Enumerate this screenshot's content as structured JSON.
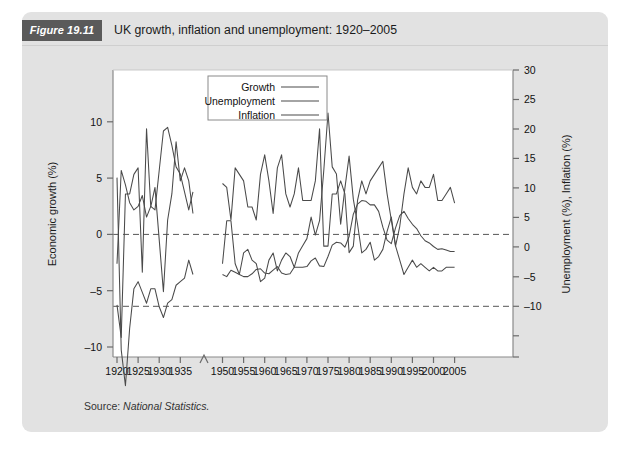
{
  "figure": {
    "badge": "Figure 19.11",
    "title": "UK growth, inflation and unemployment: 1920–2005",
    "source_prefix": "Source:",
    "source_name": "National Statistics."
  },
  "colors": {
    "card_background": "#e2e2e2",
    "badge_background": "#5a5a5a",
    "badge_text": "#ffffff",
    "plot_background": "#ffffff",
    "line": "#4a4a4a",
    "axis": "#6b6b6b",
    "dashed_reference": "#5a5a5a"
  },
  "chart_data": {
    "type": "line",
    "title": "UK growth, inflation and unemployment: 1920–2005",
    "xlabel": "",
    "ylabel": "Economic growth (%)",
    "y2label": "Unemployment (%), Inflation (%)",
    "xlim": [
      1920,
      2005
    ],
    "ylim": [
      -10,
      12
    ],
    "y2lim": [
      -10,
      30
    ],
    "grid": false,
    "legend_position": "top-center",
    "axis_break": {
      "from": 1938,
      "to": 1948,
      "note": "war years omitted"
    },
    "yticks": [
      -10,
      -5,
      0,
      5,
      10
    ],
    "y2ticks": [
      -10,
      -5,
      0,
      5,
      10,
      15,
      20,
      25,
      30
    ],
    "xticks": [
      1920,
      1925,
      1930,
      1935,
      1950,
      1955,
      1960,
      1965,
      1970,
      1975,
      1980,
      1985,
      1990,
      1995,
      2000,
      2005
    ],
    "reference_lines": [
      {
        "label": "growth zero",
        "axis": "left",
        "value": 0,
        "style": "dashed"
      },
      {
        "label": "right-axis zero",
        "axis": "right",
        "value": 0,
        "style": "dashed"
      }
    ],
    "series": [
      {
        "name": "Growth",
        "axis": "left",
        "unit": "%",
        "x": [
          1920,
          1921,
          1922,
          1923,
          1924,
          1925,
          1926,
          1927,
          1928,
          1929,
          1930,
          1931,
          1932,
          1933,
          1934,
          1935,
          1936,
          1937,
          1938,
          1950,
          1951,
          1952,
          1953,
          1954,
          1955,
          1956,
          1957,
          1958,
          1959,
          1960,
          1961,
          1962,
          1963,
          1964,
          1965,
          1966,
          1967,
          1968,
          1969,
          1970,
          1971,
          1972,
          1973,
          1974,
          1975,
          1976,
          1977,
          1978,
          1979,
          1980,
          1981,
          1982,
          1983,
          1984,
          1985,
          1986,
          1987,
          1988,
          1989,
          1990,
          1991,
          1992,
          1993,
          1994,
          1995,
          1996,
          1997,
          1998,
          1999,
          2000,
          2001,
          2002,
          2003,
          2004,
          2005
        ],
        "values": [
          -6.0,
          -8.5,
          2.5,
          2.5,
          4.0,
          4.5,
          -3.5,
          7.5,
          1.5,
          3.0,
          -1.0,
          -5.0,
          0.5,
          2.5,
          6.5,
          3.5,
          4.5,
          3.5,
          1.0,
          3.3,
          3.0,
          0.5,
          4.5,
          4.0,
          3.5,
          1.5,
          1.5,
          0.5,
          4.0,
          5.5,
          3.5,
          1.0,
          4.5,
          5.5,
          2.5,
          1.5,
          2.5,
          4.5,
          2.0,
          2.0,
          2.0,
          3.5,
          7.5,
          -1.5,
          -1.5,
          2.5,
          2.5,
          3.5,
          2.5,
          -2.0,
          -1.5,
          2.0,
          3.5,
          2.5,
          3.5,
          4.0,
          4.5,
          5.0,
          2.5,
          0.5,
          -1.5,
          0.0,
          2.5,
          4.5,
          3.0,
          2.5,
          3.5,
          3.0,
          3.0,
          4.0,
          2.0,
          2.0,
          2.5,
          3.0,
          1.8
        ],
        "notes": "1921 post-war slump trough near -9; 1973 peak ~7.5; 1975 and 1980 recessions negative"
      },
      {
        "name": "Unemployment",
        "axis": "right",
        "unit": "%",
        "x": [
          1920,
          1921,
          1922,
          1923,
          1924,
          1925,
          1926,
          1927,
          1928,
          1929,
          1930,
          1931,
          1932,
          1933,
          1934,
          1935,
          1936,
          1937,
          1938,
          1950,
          1951,
          1952,
          1953,
          1954,
          1955,
          1956,
          1957,
          1958,
          1959,
          1960,
          1961,
          1962,
          1963,
          1964,
          1965,
          1966,
          1967,
          1968,
          1969,
          1970,
          1971,
          1972,
          1973,
          1974,
          1975,
          1976,
          1977,
          1978,
          1979,
          1980,
          1981,
          1982,
          1983,
          1984,
          1985,
          1986,
          1987,
          1988,
          1989,
          1990,
          1991,
          1992,
          1993,
          1994,
          1995,
          1996,
          1997,
          1998,
          1999,
          2000,
          2001,
          2002,
          2003,
          2004,
          2005
        ],
        "values": [
          3.0,
          16.0,
          14.0,
          11.5,
          10.5,
          11.0,
          12.5,
          9.5,
          11.0,
          10.5,
          16.0,
          21.5,
          22.0,
          19.5,
          16.5,
          15.5,
          13.0,
          10.5,
          13.0,
          1.5,
          1.2,
          2.1,
          1.8,
          1.5,
          1.2,
          1.2,
          1.6,
          2.2,
          2.3,
          1.7,
          1.6,
          2.1,
          2.6,
          1.7,
          1.5,
          1.6,
          2.5,
          2.5,
          2.5,
          2.6,
          3.4,
          3.8,
          2.7,
          2.6,
          4.0,
          5.6,
          6.0,
          5.9,
          5.3,
          6.8,
          9.9,
          11.3,
          11.8,
          11.7,
          11.2,
          11.2,
          10.3,
          8.1,
          6.3,
          5.8,
          8.0,
          9.7,
          10.3,
          9.3,
          8.5,
          7.9,
          6.9,
          6.2,
          5.9,
          5.4,
          5.0,
          5.1,
          4.9,
          4.7,
          4.7
        ],
        "notes": "Interwar mass unemployment peaking ~22% in 1932; post-war low ~1-2%; 1980s peak ~12%"
      },
      {
        "name": "Inflation",
        "axis": "right",
        "unit": "%",
        "x": [
          1920,
          1921,
          1922,
          1923,
          1924,
          1925,
          1926,
          1927,
          1928,
          1929,
          1930,
          1931,
          1932,
          1933,
          1934,
          1935,
          1936,
          1937,
          1938,
          1950,
          1951,
          1952,
          1953,
          1954,
          1955,
          1956,
          1957,
          1958,
          1959,
          1960,
          1961,
          1962,
          1963,
          1964,
          1965,
          1966,
          1967,
          1968,
          1969,
          1970,
          1971,
          1972,
          1973,
          1974,
          1975,
          1976,
          1977,
          1978,
          1979,
          1980,
          1981,
          1982,
          1983,
          1984,
          1985,
          1986,
          1987,
          1988,
          1989,
          1990,
          1991,
          1992,
          1993,
          1994,
          1995,
          1996,
          1997,
          1998,
          1999,
          2000,
          2001,
          2002,
          2003,
          2004,
          2005
        ],
        "values": [
          15.0,
          -9.0,
          -14.0,
          -6.0,
          -0.5,
          0.5,
          -1.0,
          -2.5,
          -0.5,
          -0.5,
          -3.0,
          -4.5,
          -2.5,
          -2.0,
          0.0,
          0.5,
          1.0,
          3.5,
          1.5,
          3.0,
          9.0,
          9.0,
          3.0,
          1.5,
          4.5,
          5.0,
          3.5,
          3.0,
          0.5,
          1.0,
          3.5,
          4.5,
          2.0,
          3.5,
          4.5,
          4.0,
          2.5,
          4.5,
          5.5,
          6.5,
          9.5,
          7.0,
          9.0,
          16.0,
          24.0,
          16.5,
          15.5,
          8.5,
          13.5,
          18.0,
          12.0,
          8.5,
          4.5,
          5.0,
          6.0,
          3.5,
          4.0,
          5.0,
          7.5,
          9.5,
          5.5,
          3.5,
          1.5,
          2.5,
          3.5,
          2.5,
          3.0,
          2.5,
          2.0,
          2.5,
          2.0,
          2.0,
          2.5,
          2.5,
          2.5
        ],
        "notes": "Sharp post-WWI deflation to about -14% in 1922; 1975 peak about 24%; low stable ~2-3% after 1993"
      }
    ]
  },
  "legend": {
    "entries": [
      {
        "label": "Growth"
      },
      {
        "label": "Unemployment"
      },
      {
        "label": "Inflation"
      }
    ]
  }
}
